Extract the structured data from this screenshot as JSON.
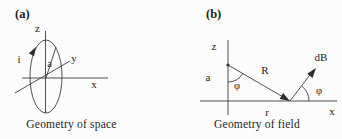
{
  "figure": {
    "background": "#fcfcfc",
    "line_color": "#3c3c3c",
    "text_color": "#1c1c1c"
  },
  "panel_a": {
    "tag": "(a)",
    "caption": "Geometry of space",
    "labels": {
      "z_axis": "z",
      "y_axis": "y",
      "x_axis": "x",
      "current": "i",
      "loop_radius": "a"
    }
  },
  "panel_b": {
    "tag": "(b)",
    "caption": "Geometry of field",
    "labels": {
      "z_axis": "z",
      "x_axis": "x",
      "source_height": "a",
      "separation": "R",
      "radial_distance": "r",
      "field_element": "dB",
      "angle_at_source": "φ",
      "angle_at_field_point": "φ"
    }
  }
}
